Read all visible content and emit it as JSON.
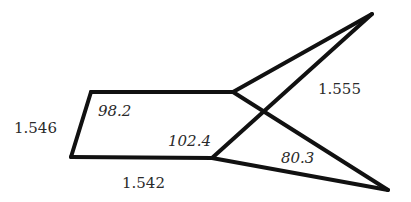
{
  "diagram": {
    "type": "molecular-geometry",
    "stroke_color": "#111111",
    "bond_lengths": [
      {
        "id": "left",
        "value": "1.546",
        "x": 14,
        "y": 133
      },
      {
        "id": "bottom",
        "value": "1.542",
        "x": 122,
        "y": 188
      },
      {
        "id": "right-diagonal",
        "value": "1.555",
        "x": 318,
        "y": 94
      }
    ],
    "angles": [
      {
        "id": "top-left",
        "value": "98.2",
        "x": 98,
        "y": 116
      },
      {
        "id": "bottom-right",
        "value": "102.4",
        "x": 168,
        "y": 146
      },
      {
        "id": "lower-wedge",
        "value": "80.3",
        "x": 281,
        "y": 163
      }
    ],
    "vertices": {
      "top_left": [
        91,
        92
      ],
      "bottom_left": [
        71,
        157
      ],
      "top_junction": [
        233,
        92
      ],
      "bottom_junction": [
        212,
        158
      ],
      "top_tip": [
        372,
        14
      ],
      "bottom_tip": [
        388,
        190
      ]
    }
  }
}
